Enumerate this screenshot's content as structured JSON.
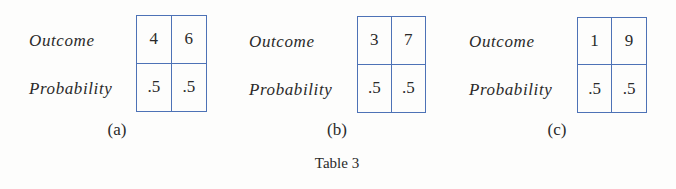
{
  "tables": [
    {
      "id": "a",
      "row_labels": [
        "Outcome",
        "Probability"
      ],
      "outcomes": [
        "4",
        "6"
      ],
      "probabilities": [
        ".5",
        ".5"
      ],
      "sublabel": "(a)"
    },
    {
      "id": "b",
      "row_labels": [
        "Outcome",
        "Probability"
      ],
      "outcomes": [
        "3",
        "7"
      ],
      "probabilities": [
        ".5",
        ".5"
      ],
      "sublabel": "(b)"
    },
    {
      "id": "c",
      "row_labels": [
        "Outcome",
        "Probability"
      ],
      "outcomes": [
        "1",
        "9"
      ],
      "probabilities": [
        ".5",
        ".5"
      ],
      "sublabel": "(c)"
    }
  ],
  "caption": "Table 3",
  "colors": {
    "border": "#4d72b6",
    "text": "#2a2a2a",
    "background": "#fdfdfc"
  }
}
